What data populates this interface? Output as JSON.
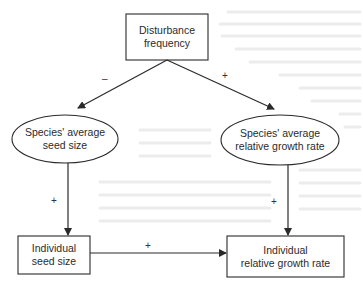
{
  "diagram": {
    "nodes": {
      "disturbance": {
        "shape": "rectangle",
        "lines": [
          "Disturbance",
          "frequency"
        ]
      },
      "species_seed": {
        "shape": "ellipse",
        "lines": [
          "Species' average",
          "seed size"
        ]
      },
      "species_rgr": {
        "shape": "ellipse",
        "lines": [
          "Species' average",
          "relative growth rate"
        ]
      },
      "individual_seed": {
        "shape": "rectangle",
        "lines": [
          "Individual",
          "seed size"
        ]
      },
      "individual_rgr": {
        "shape": "rectangle",
        "lines": [
          "Individual",
          "relative growth rate"
        ]
      }
    },
    "edges": [
      {
        "from": "Disturbance frequency",
        "to": "Species' average seed size",
        "sign": "–"
      },
      {
        "from": "Disturbance frequency",
        "to": "Species' average relative growth rate",
        "sign": "+"
      },
      {
        "from": "Species' average seed size",
        "to": "Individual seed size",
        "sign": "+"
      },
      {
        "from": "Species' average relative growth rate",
        "to": "Individual relative growth rate",
        "sign": "+"
      },
      {
        "from": "Individual seed size",
        "to": "Individual relative growth rate",
        "sign": "+"
      }
    ],
    "colors": {
      "stroke": "#2a2a2a",
      "background": "#ffffff"
    }
  }
}
